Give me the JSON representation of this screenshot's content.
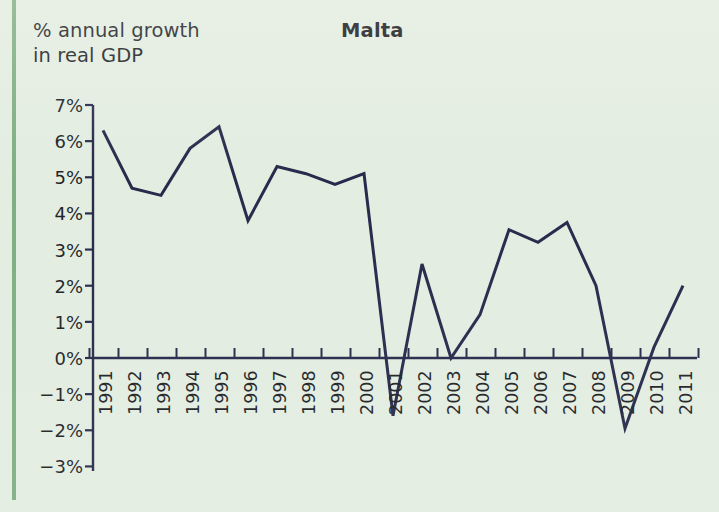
{
  "page": {
    "background_color": "#e2ecdf",
    "rule_color": "#7bab7d"
  },
  "axis_caption": "% annual growth\nin real GDP",
  "chart_data": {
    "type": "line",
    "title": "Malta",
    "xlabel": "",
    "ylabel": "% annual growth in real GDP",
    "ylim": [
      -3,
      7
    ],
    "ytick_values": [
      7,
      6,
      5,
      4,
      3,
      2,
      1,
      0,
      -1,
      -2,
      -3
    ],
    "ytick_labels": [
      "7%",
      "6%",
      "5%",
      "4%",
      "3%",
      "2%",
      "1%",
      "0%",
      "−1%",
      "−2%",
      "−3%"
    ],
    "grid": false,
    "legend": "none",
    "line_color": "#1e2244",
    "categories": [
      "1991",
      "1992",
      "1993",
      "1994",
      "1995",
      "1996",
      "1997",
      "1998",
      "1999",
      "2000",
      "2001",
      "2002",
      "2003",
      "2004",
      "2005",
      "2006",
      "2007",
      "2008",
      "2009",
      "2010",
      "2011"
    ],
    "values": [
      6.3,
      4.7,
      4.5,
      5.8,
      6.4,
      3.8,
      5.3,
      5.1,
      4.8,
      5.1,
      -1.6,
      2.6,
      0.0,
      1.2,
      3.55,
      3.2,
      3.75,
      2.0,
      -1.95,
      0.3,
      2.0
    ]
  }
}
